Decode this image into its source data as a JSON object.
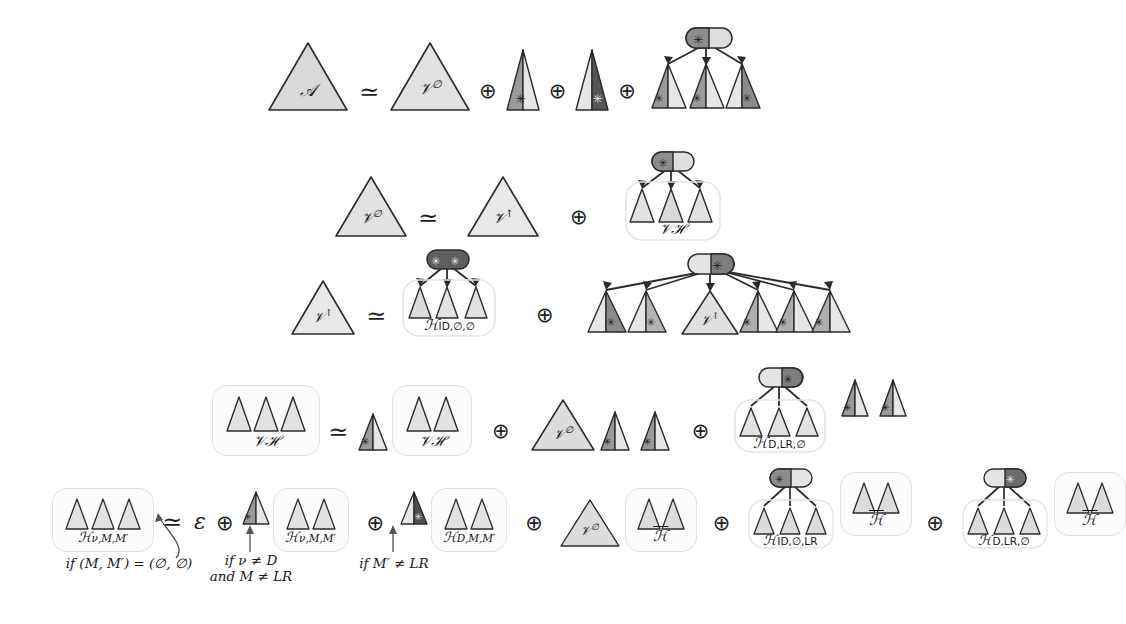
{
  "figure": {
    "type": "grammar-derivation-diagram",
    "colors": {
      "light_fill": "#d9d9d9",
      "mid_fill": "#a8a8a8",
      "dark_fill": "#6e6e6e",
      "very_dark_fill": "#555555",
      "stroke": "#2b2b2b",
      "group_border": "#e2e2e2",
      "text": "#1a1a1a"
    },
    "symbols": {
      "simeq": "≃",
      "oplus": "⊕",
      "epsilon": "ε",
      "star": "✳",
      "emptyset": "∅",
      "neq": "≠",
      "uparrow": "↑"
    }
  },
  "rows": [
    {
      "id": "row-1",
      "lhs": "𝒜",
      "relation": "≃",
      "terms": [
        {
          "kind": "triangle",
          "label": "𝒱∅"
        },
        {
          "kind": "triangle",
          "label": ""
        },
        {
          "kind": "triangle",
          "label": ""
        },
        {
          "kind": "tree",
          "label": ""
        }
      ]
    },
    {
      "id": "row-2",
      "lhs": "𝒱∅",
      "relation": "≃",
      "terms": [
        {
          "kind": "triangle",
          "label": "𝒱↑"
        },
        {
          "kind": "tree",
          "label": "𝒱ℋ"
        }
      ]
    },
    {
      "id": "row-3",
      "lhs": "𝒱↑",
      "relation": "≃",
      "terms": [
        {
          "kind": "tree",
          "label": "ℋ",
          "sub": "ID,∅,∅"
        },
        {
          "kind": "tree-wide",
          "label": "𝒱↑"
        }
      ]
    },
    {
      "id": "row-4",
      "lhs": "𝒱ℋ",
      "relation": "≃",
      "terms": [
        {
          "kind": "group",
          "label": "𝒱ℋ"
        },
        {
          "kind": "triangle",
          "label": "𝒱∅"
        },
        {
          "kind": "tree",
          "label": "ℋ",
          "sub": "D,LR,∅"
        }
      ]
    },
    {
      "id": "row-5",
      "lhs": "ℋ",
      "lhs_sub": "ν,M,M′",
      "relation": "≃",
      "terms": [
        {
          "kind": "epsilon",
          "label": "ε",
          "condition": "if (M, M′) = (∅, ∅)"
        },
        {
          "kind": "group",
          "label": "ℋ",
          "sub": "ν,M,M′",
          "condition_line1": "if ν ≠ D",
          "condition_line2": "and M ≠ LR"
        },
        {
          "kind": "group",
          "label": "ℋ",
          "sub": "D,M,M′",
          "condition": "if M′ ≠ LR"
        },
        {
          "kind": "group",
          "label": "𝒱∅ ℋ̄"
        },
        {
          "kind": "tree",
          "label": "ℋ",
          "sub": "ID,∅,LR",
          "trailing": "ℋ̄"
        },
        {
          "kind": "tree",
          "label": "ℋ",
          "sub": "D,LR,∅",
          "trailing": "ℋ̄"
        }
      ]
    }
  ],
  "labels": {
    "A": "𝒜",
    "V_empty": "𝒱",
    "V_empty_sup": "∅",
    "V_up": "𝒱",
    "V_up_sup": "↑",
    "VH": "𝒱ℋ",
    "H": "ℋ",
    "Hbar": "ℋ",
    "sub_ID_e_e": "ID,∅,∅",
    "sub_D_LR_e": "D,LR,∅",
    "sub_ID_e_LR": "ID,∅,LR",
    "sub_nu_M_Mp": "ν,M,M′",
    "sub_D_M_Mp": "D,M,M′",
    "epsilon": "ε",
    "simeq": "≃",
    "oplus": "⊕"
  },
  "conditions": [
    {
      "id": "cond-1",
      "text": "if (M, M′) = (∅, ∅)"
    },
    {
      "id": "cond-2",
      "line1": "if ν ≠ D",
      "line2": "and M ≠ LR"
    },
    {
      "id": "cond-3",
      "text": "if M′ ≠ LR"
    }
  ]
}
